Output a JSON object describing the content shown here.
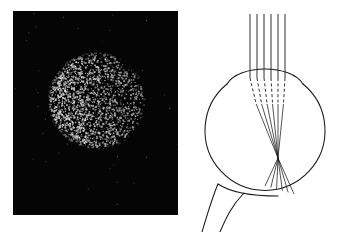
{
  "figure": {
    "title": "Scattered-light fundus photograph and schematic eye ray diagram",
    "background_color": "#ffffff",
    "panels": [
      {
        "id": "photo",
        "name": "fundus-photograph",
        "type": "photograph",
        "caption": "",
        "frame": {
          "x": 13,
          "y": 11,
          "width": 165,
          "height": 204
        },
        "background_color": "#050505",
        "content": {
          "kind": "speckled-disc",
          "description": "Bright white speckle dots forming a circular disc on a black field",
          "disc": {
            "center_x": 83,
            "center_y": 89,
            "radius": 49
          },
          "dot_color": "#ffffff",
          "dot_count": 2600,
          "dot_size_min": 0.6,
          "dot_size_max": 1.9,
          "density_gradient": "denser and brighter toward the left of the disc, sparser toward the right edge",
          "seed": 20240517
        }
      },
      {
        "id": "diagram",
        "name": "eye-ray-diagram",
        "type": "line-drawing",
        "caption": "",
        "frame": {
          "x": 182,
          "y": 0,
          "width": 160,
          "height": 232
        },
        "background_color": "#ffffff",
        "stroke_color": "#1a1a1a",
        "content": {
          "kind": "schematic-eye-with-rays",
          "parts": [
            {
              "name": "globe",
              "label": "eyeball globe",
              "shape": "circle",
              "center_x": 83,
              "center_y": 138,
              "radius_x": 60,
              "radius_y": 60
            },
            {
              "name": "cornea",
              "label": "cornea and lens dome",
              "shape": "arc",
              "description": "anterior bulge across the top of the globe"
            },
            {
              "name": "optic-nerve",
              "label": "optic nerve stalk",
              "shape": "tapered-tube",
              "description": "exits the lower-left of the globe toward bottom edge"
            },
            {
              "name": "retina",
              "label": "retinal surface",
              "shape": "arc",
              "description": "lower inner wall of the globe where rays land"
            }
          ],
          "rays": {
            "count": 6,
            "label": "incident parallel light rays",
            "style_outside": "solid",
            "style_inside_cornea": "dashed",
            "style_after_lens": "solid",
            "entry_y": 14,
            "entry_x_positions": [
              68,
              75,
              82,
              89,
              96,
              103
            ],
            "cornea_y": 78,
            "focal_point": {
              "x": 96,
              "y": 158
            },
            "retina_landing_y": 196,
            "retina_landing_x_span": [
              83,
              112
            ]
          }
        }
      }
    ]
  }
}
